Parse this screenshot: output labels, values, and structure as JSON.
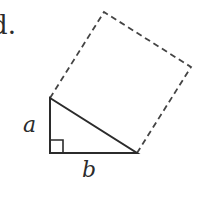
{
  "text_fragment": "d.",
  "labels": {
    "a": "a",
    "b": "b"
  },
  "colors": {
    "stroke": "#2b2b2b",
    "dashed": "#444444",
    "background": "#ffffff"
  },
  "triangle": {
    "right_angle_vertex": [
      50,
      153
    ],
    "leg_a_end": [
      50,
      98
    ],
    "leg_b_end": [
      137,
      153
    ]
  },
  "square_on_hypotenuse": {
    "vertices": [
      [
        50,
        98
      ],
      [
        137,
        153
      ],
      [
        191,
        67
      ],
      [
        104,
        12
      ]
    ],
    "style": "dashed"
  }
}
